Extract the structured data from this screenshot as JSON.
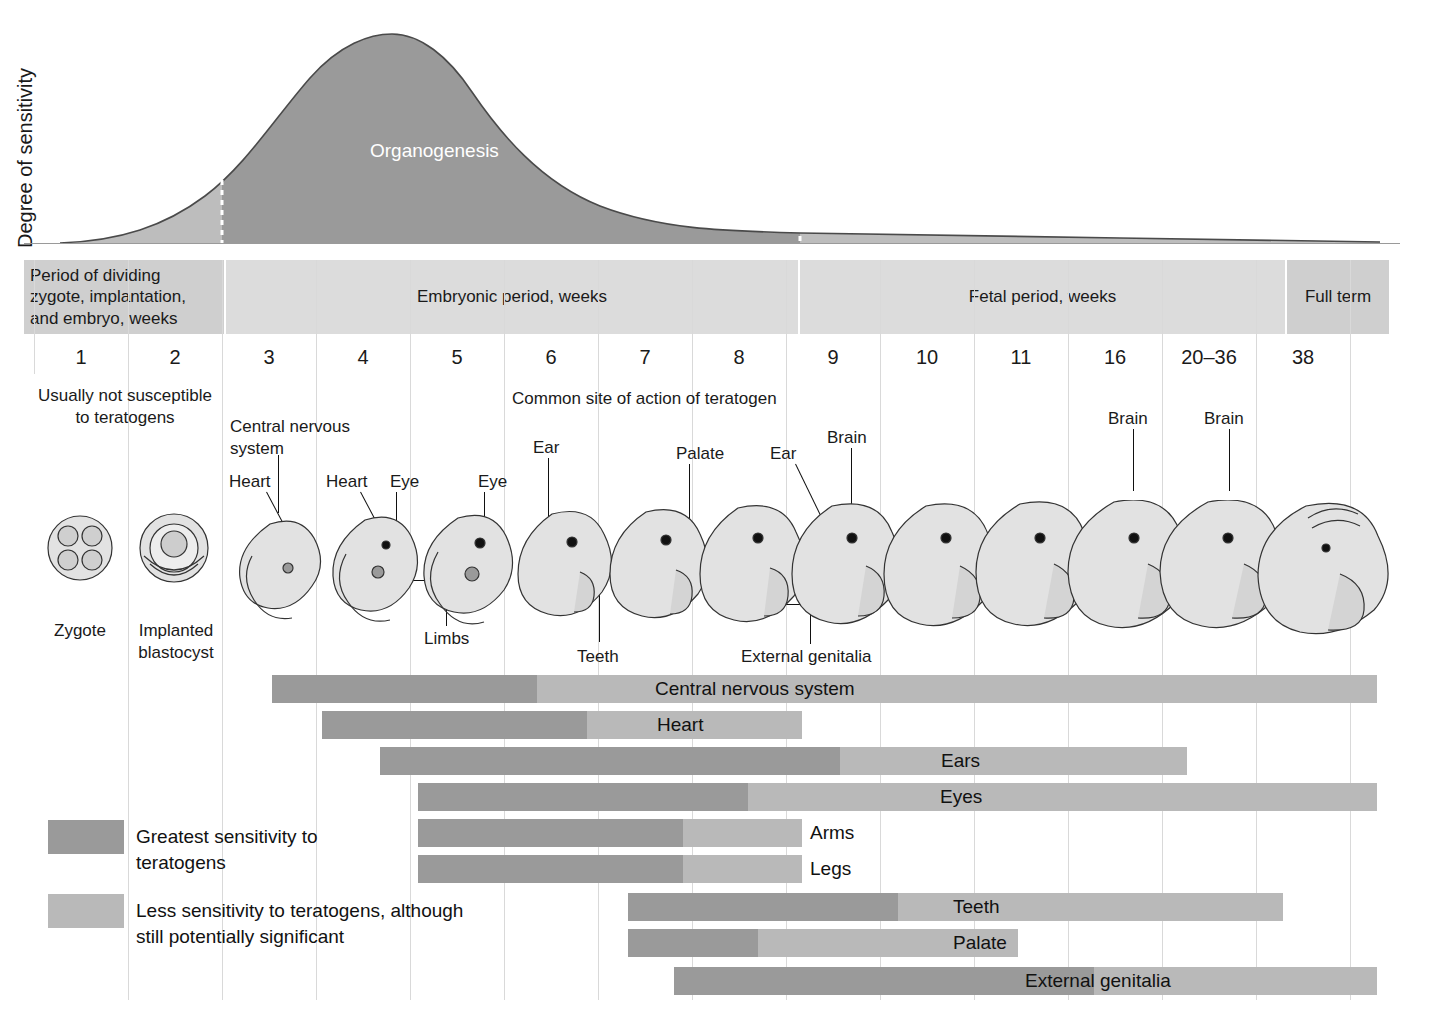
{
  "figure": {
    "y_axis_label": "Degree of sensitivity",
    "curve_label": "Organogenesis",
    "headline_note": "Common site of action of teratogen",
    "left_note": "Usually not susceptible to teratogens"
  },
  "period_bands": [
    {
      "id": "dividing",
      "label": "Period of dividing zygote, implantation, and embryo, weeks",
      "tone": "dark"
    },
    {
      "id": "embryonic",
      "label": "Embryonic period, weeks",
      "tone": "light"
    },
    {
      "id": "fetal",
      "label": "Fetal period, weeks",
      "tone": "light"
    },
    {
      "id": "fullterm",
      "label": "Full term",
      "tone": "dark"
    }
  ],
  "weeks": [
    "1",
    "2",
    "3",
    "4",
    "5",
    "6",
    "7",
    "8",
    "9",
    "10",
    "11",
    "16",
    "20–36",
    "38"
  ],
  "stage_captions": [
    {
      "id": "zygote",
      "label": "Zygote"
    },
    {
      "id": "blastocyst",
      "label": "Implanted blastocyst"
    }
  ],
  "callouts": [
    {
      "id": "central-nervous-system",
      "label": "Central nervous system"
    },
    {
      "id": "heart-w3",
      "label": "Heart"
    },
    {
      "id": "heart-w4",
      "label": "Heart"
    },
    {
      "id": "eye-w4",
      "label": "Eye"
    },
    {
      "id": "eye-w5",
      "label": "Eye"
    },
    {
      "id": "ear-w6",
      "label": "Ear"
    },
    {
      "id": "palate-w7",
      "label": "Palate"
    },
    {
      "id": "ear-w8",
      "label": "Ear"
    },
    {
      "id": "brain-w9",
      "label": "Brain"
    },
    {
      "id": "brain-w16",
      "label": "Brain"
    },
    {
      "id": "brain-w20",
      "label": "Brain"
    },
    {
      "id": "limbs",
      "label": "Limbs"
    },
    {
      "id": "teeth",
      "label": "Teeth"
    },
    {
      "id": "external-genitalia",
      "label": "External genitalia"
    }
  ],
  "legend": [
    {
      "id": "greatest",
      "tone": "hi",
      "label": "Greatest sensitivity to teratogens"
    },
    {
      "id": "less",
      "tone": "lo",
      "label": "Less sensitivity to teratogens, although still potentially significant"
    }
  ],
  "colors": {
    "high_sensitivity": "#9a9a9a",
    "low_sensitivity": "#b9b9b9",
    "band_dark": "#cfcfcf",
    "band_light": "#dcdcdc",
    "gridline": "#d9d9d9",
    "curve_high": "#9a9a9a",
    "curve_low": "#bdbdbd",
    "text": "#1a1a1a"
  },
  "chart_data": {
    "type": "bar",
    "xlabel": "Weeks of gestation",
    "ylabel": "Degree of sensitivity",
    "grid": true,
    "legend_position": "bottom-left",
    "x_ticks": [
      "1",
      "2",
      "3",
      "4",
      "5",
      "6",
      "7",
      "8",
      "9",
      "10",
      "11",
      "16",
      "20–36",
      "38"
    ],
    "x_tick_weeks": [
      1,
      2,
      3,
      4,
      5,
      6,
      7,
      8,
      9,
      10,
      11,
      16,
      26,
      38
    ],
    "sensitivity_curve": {
      "description": "Degree of sensitivity to teratogens across gestation; rises through weeks 1–2, peaks in early organogenesis (~week 4), declines through the fetal period",
      "peak_week": 4,
      "organogenesis_span_weeks": [
        3,
        8
      ],
      "markers": [
        {
          "week": 3,
          "style": "dashed",
          "note": "start of greatest sensitivity"
        },
        {
          "week": 8.5,
          "style": "dashed",
          "note": "end of embryonic period"
        }
      ],
      "points": [
        {
          "week": 1,
          "sensitivity": 0.02
        },
        {
          "week": 1.6,
          "sensitivity": 0.08
        },
        {
          "week": 2.2,
          "sensitivity": 0.22
        },
        {
          "week": 3.0,
          "sensitivity": 0.48
        },
        {
          "week": 3.5,
          "sensitivity": 0.78
        },
        {
          "week": 4.0,
          "sensitivity": 1.0
        },
        {
          "week": 4.6,
          "sensitivity": 0.93
        },
        {
          "week": 5.3,
          "sensitivity": 0.74
        },
        {
          "week": 6.2,
          "sensitivity": 0.48
        },
        {
          "week": 7.2,
          "sensitivity": 0.3
        },
        {
          "week": 8.5,
          "sensitivity": 0.18
        },
        {
          "week": 10,
          "sensitivity": 0.13
        },
        {
          "week": 16,
          "sensitivity": 0.09
        },
        {
          "week": 26,
          "sensitivity": 0.06
        },
        {
          "week": 38,
          "sensitivity": 0.04
        }
      ]
    },
    "organ_bars": [
      {
        "organ": "Central nervous system",
        "high_start_week": 3,
        "high_end_week": 6,
        "low_end_week": 38
      },
      {
        "organ": "Heart",
        "high_start_week": 3.5,
        "high_end_week": 7,
        "low_end_week": 8.5
      },
      {
        "organ": "Ears",
        "high_start_week": 4.2,
        "high_end_week": 9.5,
        "low_end_week": 16.5
      },
      {
        "organ": "Eyes",
        "high_start_week": 4.6,
        "high_end_week": 8,
        "low_end_week": 38
      },
      {
        "organ": "Arms",
        "high_start_week": 4.6,
        "high_end_week": 7,
        "low_end_week": 8.5
      },
      {
        "organ": "Legs",
        "high_start_week": 4.6,
        "high_end_week": 7,
        "low_end_week": 8.5
      },
      {
        "organ": "Teeth",
        "high_start_week": 6.8,
        "high_end_week": 9.7,
        "low_end_week": 20
      },
      {
        "organ": "Palate",
        "high_start_week": 6.8,
        "high_end_week": 8.2,
        "low_end_week": 11.2
      },
      {
        "organ": "External genitalia",
        "high_start_week": 7.3,
        "high_end_week": 9.5,
        "low_end_week": 38
      }
    ]
  },
  "bars": [
    {
      "id": "central-nervous-system",
      "label": "Central nervous system",
      "hi_x": 272,
      "hi_w": 265,
      "lo_x": 537,
      "lo_w": 840,
      "label_x": 655,
      "y": 675
    },
    {
      "id": "heart",
      "label": "Heart",
      "hi_x": 322,
      "hi_w": 265,
      "lo_x": 587,
      "lo_w": 215,
      "label_x": 657,
      "y": 711
    },
    {
      "id": "ears",
      "label": "Ears",
      "hi_x": 380,
      "hi_w": 460,
      "lo_x": 840,
      "lo_w": 347,
      "label_x": 941,
      "y": 747
    },
    {
      "id": "eyes",
      "label": "Eyes",
      "hi_x": 418,
      "hi_w": 330,
      "lo_x": 748,
      "lo_w": 629,
      "label_x": 940,
      "y": 783
    },
    {
      "id": "arms",
      "label": "Arms",
      "hi_x": 418,
      "hi_w": 265,
      "lo_x": 683,
      "lo_w": 119,
      "label_x": 810,
      "y": 819
    },
    {
      "id": "legs",
      "label": "Legs",
      "hi_x": 418,
      "hi_w": 265,
      "lo_x": 683,
      "lo_w": 119,
      "label_x": 810,
      "y": 855
    },
    {
      "id": "teeth",
      "label": "Teeth",
      "hi_x": 628,
      "hi_w": 270,
      "lo_x": 898,
      "lo_w": 385,
      "label_x": 953,
      "y": 893
    },
    {
      "id": "palate",
      "label": "Palate",
      "hi_x": 628,
      "hi_w": 130,
      "lo_x": 758,
      "lo_w": 260,
      "label_x": 953,
      "y": 929
    },
    {
      "id": "external-genitalia",
      "label": "External genitalia",
      "hi_x": 674,
      "hi_w": 420,
      "lo_x": 1094,
      "lo_w": 283,
      "label_x": 1025,
      "y": 967
    }
  ]
}
